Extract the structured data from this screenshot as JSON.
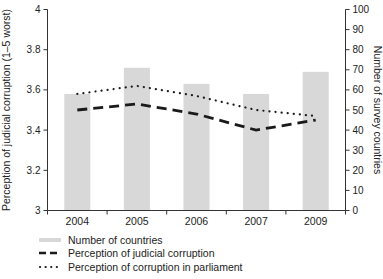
{
  "chart_data": {
    "type": "bar",
    "subtype": "bar-line-combo",
    "title": "",
    "categories": [
      "2004",
      "2005",
      "2006",
      "2007",
      "2009"
    ],
    "series": [
      {
        "name": "Number of countries",
        "type": "bar",
        "axis": "right",
        "values": [
          58,
          71,
          63,
          58,
          69
        ],
        "color": "#d8d8d8"
      },
      {
        "name": "Perception of judicial corruption",
        "type": "line",
        "style": "dashed",
        "axis": "left",
        "values": [
          3.5,
          3.53,
          3.48,
          3.4,
          3.45
        ],
        "color": "#1a1a1a"
      },
      {
        "name": "Perception of corruption in parliament",
        "type": "line",
        "style": "dotted",
        "axis": "left",
        "values": [
          3.58,
          3.62,
          3.57,
          3.5,
          3.47
        ],
        "color": "#1a1a1a"
      }
    ],
    "left_axis": {
      "label": "Perception of judicial corruption (1–5 worst)",
      "min": 3,
      "max": 4,
      "ticks": [
        3,
        3.2,
        3.4,
        3.6,
        3.8,
        4
      ]
    },
    "right_axis": {
      "label": "Number of survey countries",
      "min": 0,
      "max": 100,
      "ticks": [
        0,
        10,
        20,
        30,
        40,
        50,
        60,
        70,
        80,
        90,
        100
      ]
    },
    "grid": false,
    "legend_position": "bottom-left",
    "axis_color": "#333333",
    "text_color": "#222222",
    "background": "#ffffff"
  }
}
